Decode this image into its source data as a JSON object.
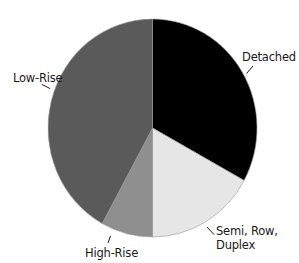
{
  "chart_data": {
    "type": "pie",
    "title": "",
    "start_angle_deg": 0,
    "direction": "clockwise",
    "slices": [
      {
        "label": "Detached",
        "value": 33,
        "color": "#000000"
      },
      {
        "label": "Semi, Row, Duplex",
        "value": 17,
        "color": "#e6e6e6"
      },
      {
        "label": "High-Rise",
        "value": 8,
        "color": "#8f8f8f"
      },
      {
        "label": "Low-Rise",
        "value": 42,
        "color": "#5a5a5a"
      }
    ],
    "categories": [
      "Detached",
      "Semi, Row, Duplex",
      "High-Rise",
      "Low-Rise"
    ],
    "values": [
      33,
      17,
      8,
      42
    ],
    "legend": "none (direct labels with leader lines)"
  },
  "labels": {
    "detached": "Detached",
    "semi_line1": "Semi, Row,",
    "semi_line2": "Duplex",
    "high_rise": "High-Rise",
    "low_rise": "Low-Rise"
  }
}
